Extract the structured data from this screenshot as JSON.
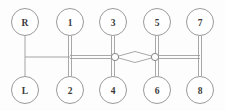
{
  "diagram": {
    "type": "network-schematic",
    "background_color": "#fdfdfd",
    "stroke_color": "#9a9a9a",
    "stroke_color_dark": "#868686",
    "label_color": "#3a3a3a",
    "node_fill": "#ffffff",
    "node_radius": 13.5,
    "junction_radius": 3.6,
    "bus_y": 57,
    "top_row_y": 22,
    "bottom_row_y": 90,
    "nodes": [
      {
        "id": "R",
        "label": "R",
        "cx": 25,
        "cy": 22,
        "row": "top"
      },
      {
        "id": "N1",
        "label": "1",
        "cx": 70,
        "cy": 22,
        "row": "top"
      },
      {
        "id": "N3",
        "label": "3",
        "cx": 113,
        "cy": 22,
        "row": "top"
      },
      {
        "id": "N5",
        "label": "5",
        "cx": 157,
        "cy": 22,
        "row": "top"
      },
      {
        "id": "N7",
        "label": "7",
        "cx": 200,
        "cy": 22,
        "row": "top"
      },
      {
        "id": "L",
        "label": "L",
        "cx": 25,
        "cy": 90,
        "row": "bottom"
      },
      {
        "id": "N2",
        "label": "2",
        "cx": 70,
        "cy": 90,
        "row": "bottom"
      },
      {
        "id": "N4",
        "label": "4",
        "cx": 113,
        "cy": 90,
        "row": "bottom"
      },
      {
        "id": "N6",
        "label": "6",
        "cx": 157,
        "cy": 90,
        "row": "bottom"
      },
      {
        "id": "N8",
        "label": "8",
        "cx": 200,
        "cy": 90,
        "row": "bottom"
      }
    ],
    "junctions": [
      {
        "id": "J1",
        "cx": 115,
        "cy": 57
      },
      {
        "id": "J2",
        "cx": 155,
        "cy": 57
      }
    ],
    "vertical_links": [
      {
        "id": "V-RL",
        "x": 25,
        "y1": 35.5,
        "y2": 76.5,
        "style": "single"
      },
      {
        "id": "V-12",
        "x": 70,
        "y1": 35.5,
        "y2": 76.5,
        "style": "double"
      },
      {
        "id": "V-34",
        "x": 113,
        "y1": 35.5,
        "y2": 76.5,
        "style": "double"
      },
      {
        "id": "V-56",
        "x": 157,
        "y1": 35.5,
        "y2": 76.5,
        "style": "double"
      },
      {
        "id": "V-78",
        "x": 200,
        "y1": 35.5,
        "y2": 76.5,
        "style": "double"
      }
    ],
    "horizontal_links": [
      {
        "id": "H-R-1",
        "y": 57,
        "x1": 25,
        "x2": 70,
        "style": "single"
      },
      {
        "id": "H-1-3",
        "y": 57,
        "x1": 70,
        "x2": 115,
        "style": "double"
      },
      {
        "id": "H-5-7",
        "y": 57,
        "x1": 155,
        "x2": 200,
        "style": "double"
      }
    ],
    "lens_link": {
      "id": "lens-3-5",
      "x1": 115,
      "x2": 155,
      "cy": 57,
      "half_height": 5.5,
      "description": "pointed-oval double arc between junction J1 and junction J2"
    }
  }
}
